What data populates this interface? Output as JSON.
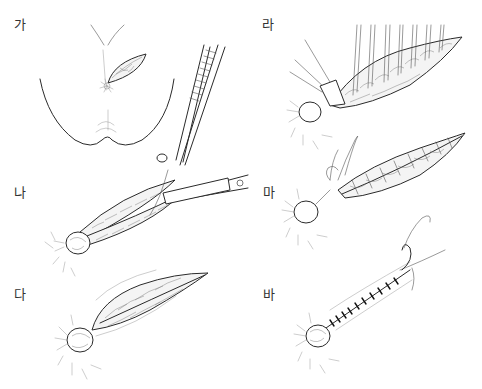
{
  "figure": {
    "panels": [
      {
        "id": "ga",
        "label": "가",
        "position": "top-left",
        "depicts": "buttock view with small elliptical wound near anus"
      },
      {
        "id": "na",
        "label": "나",
        "position": "middle-left",
        "depicts": "wound incised, tissue held with forceps and cut with scissors"
      },
      {
        "id": "da",
        "label": "다",
        "position": "bottom-left",
        "depicts": "laid-open elongated wound with exposed tissue bed"
      },
      {
        "id": "ra",
        "label": "라",
        "position": "top-right",
        "depicts": "wound with multiple vertical sutures placed through tissue"
      },
      {
        "id": "ma",
        "label": "마",
        "position": "middle-right",
        "depicts": "wound with interrupted sutures tied across, thread looped at anal end"
      },
      {
        "id": "ba",
        "label": "바",
        "position": "bottom-right",
        "depicts": "wound closed with suture line, needle at distal end"
      }
    ]
  },
  "colors": {
    "background": "#ffffff",
    "ink": "#2a2a2a",
    "label": "#333333"
  }
}
